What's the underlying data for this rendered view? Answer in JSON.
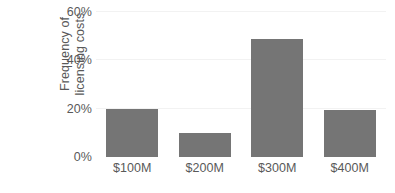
{
  "chart_data": {
    "type": "bar",
    "title": "",
    "subtitle": "",
    "xlabel": "",
    "ylabel": "Frequency of licensing costs",
    "ylabel_lines": [
      "Frequency of",
      "licensing costs"
    ],
    "categories": [
      "$100M",
      "$200M",
      "$300M",
      "$400M"
    ],
    "values": [
      20,
      10,
      49,
      19.5
    ],
    "value_labels": [
      "20%",
      "10%",
      "49%",
      "19.5%"
    ],
    "ylim": [
      0,
      60
    ],
    "yticks": [
      0,
      20,
      40,
      60
    ],
    "ytick_labels": [
      "0%",
      "20%",
      "40%",
      "60%"
    ],
    "grid": "horizontal-faint",
    "legend": "none",
    "annotations": [],
    "colors": {
      "bar": "#757575",
      "text": "#595959",
      "gridline": "#f2f2f2",
      "background": "#ffffff"
    }
  }
}
